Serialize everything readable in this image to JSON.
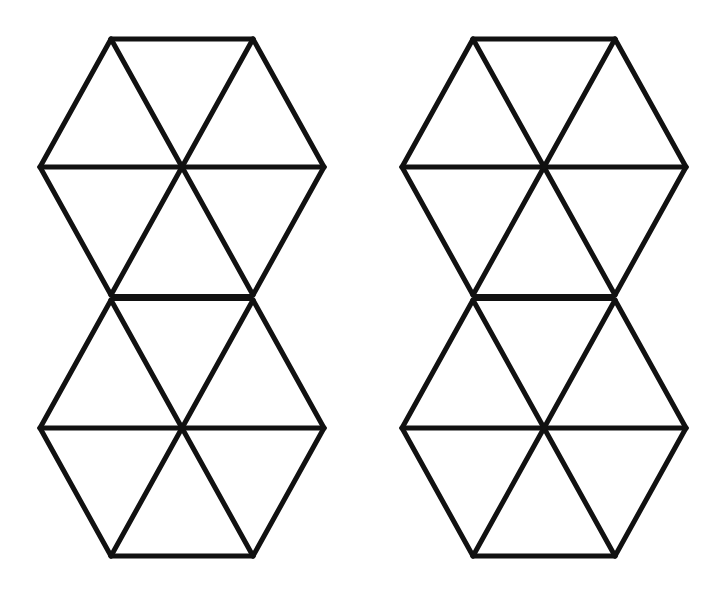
{
  "figure": {
    "figures": [
      {
        "name": "left-figure",
        "hexagons": 2,
        "triangles_per_hexagon": 6,
        "shared_edge": "horizontal"
      },
      {
        "name": "right-figure",
        "hexagons": 2,
        "triangles_per_hexagon": 6,
        "shared_edge": "horizontal"
      }
    ],
    "colors": {
      "stroke": "#111111",
      "background": "#ffffff"
    }
  }
}
